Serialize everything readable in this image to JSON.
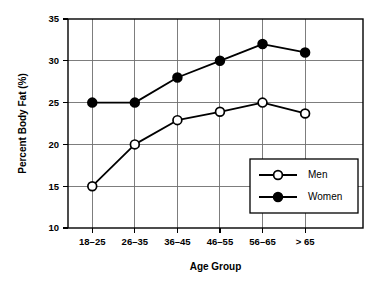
{
  "chart_data": {
    "type": "line",
    "title": "",
    "xlabel": "Age Group",
    "ylabel": "Percent Body Fat (%)",
    "categories": [
      "18–25",
      "26–35",
      "36–45",
      "46–55",
      "56–65",
      "> 65"
    ],
    "series": [
      {
        "name": "Men",
        "marker": "open-circle",
        "color": "#000000",
        "values": [
          15,
          20,
          22.9,
          23.9,
          25,
          23.7
        ]
      },
      {
        "name": "Women",
        "marker": "filled-circle",
        "color": "#000000",
        "values": [
          25,
          25,
          28,
          30,
          32,
          31
        ]
      }
    ],
    "ylim": [
      10,
      35
    ],
    "yticks": [
      10,
      15,
      20,
      25,
      30,
      35
    ],
    "ytick_labels": [
      "10",
      "15",
      "20",
      "25",
      "30",
      "35"
    ],
    "grid": true,
    "grid_color": "#6f6f6f",
    "legend_position": "lower-right-inside",
    "background": "#ffffff",
    "axis_color": "#000000"
  }
}
